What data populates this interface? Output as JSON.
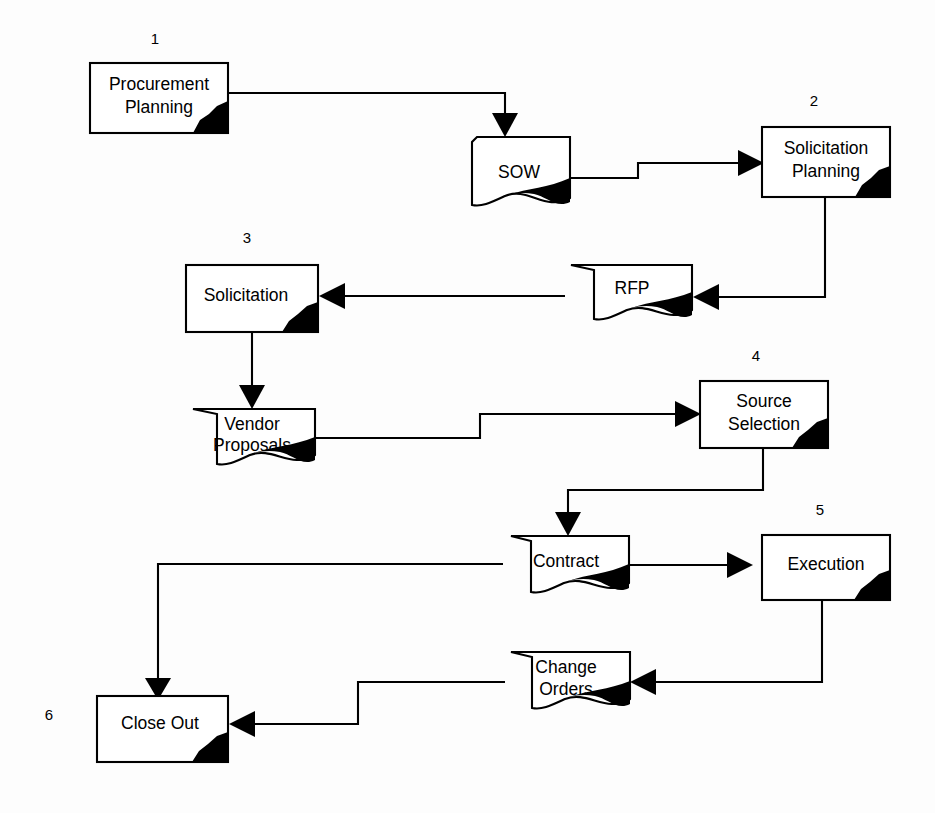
{
  "diagram": {
    "background_color": "#fdfdfd",
    "line_color": "#000000",
    "shape_fill": "#ffffff",
    "shadow_color": "#000000",
    "nodes": [
      {
        "id": "procurement-planning",
        "shape": "process-box",
        "line1": "Procurement",
        "line2": "Planning",
        "step_number": "1"
      },
      {
        "id": "sow",
        "shape": "document",
        "line1": "SOW",
        "line2": "",
        "step_number": ""
      },
      {
        "id": "solicitation-planning",
        "shape": "process-box",
        "line1": "Solicitation",
        "line2": "Planning",
        "step_number": "2"
      },
      {
        "id": "solicitation",
        "shape": "process-box",
        "line1": "Solicitation",
        "line2": "",
        "step_number": "3"
      },
      {
        "id": "rfp",
        "shape": "document",
        "line1": "RFP",
        "line2": "",
        "step_number": ""
      },
      {
        "id": "vendor-proposals",
        "shape": "document",
        "line1": "Vendor",
        "line2": "Proposals",
        "step_number": ""
      },
      {
        "id": "source-selection",
        "shape": "process-box",
        "line1": "Source",
        "line2": "Selection",
        "step_number": "4"
      },
      {
        "id": "contract",
        "shape": "document",
        "line1": "Contract",
        "line2": "",
        "step_number": ""
      },
      {
        "id": "execution",
        "shape": "process-box",
        "line1": "Execution",
        "line2": "",
        "step_number": "5"
      },
      {
        "id": "change-orders",
        "shape": "document",
        "line1": "Change",
        "line2": "Orders",
        "step_number": ""
      },
      {
        "id": "close-out",
        "shape": "process-box",
        "line1": "Close Out",
        "line2": "",
        "step_number": "6"
      }
    ],
    "edges": [
      {
        "id": "edge-planning-to-sow",
        "from": "procurement-planning",
        "to": "sow"
      },
      {
        "id": "edge-sow-to-solicitation-planning",
        "from": "sow",
        "to": "solicitation-planning"
      },
      {
        "id": "edge-solicitation-planning-to-rfp",
        "from": "solicitation-planning",
        "to": "rfp"
      },
      {
        "id": "edge-rfp-to-solicitation",
        "from": "rfp",
        "to": "solicitation"
      },
      {
        "id": "edge-solicitation-to-vendor-proposals",
        "from": "solicitation",
        "to": "vendor-proposals"
      },
      {
        "id": "edge-vendor-proposals-to-source-selection",
        "from": "vendor-proposals",
        "to": "source-selection"
      },
      {
        "id": "edge-source-selection-to-contract",
        "from": "source-selection",
        "to": "contract"
      },
      {
        "id": "edge-contract-to-execution",
        "from": "contract",
        "to": "execution"
      },
      {
        "id": "edge-execution-to-change-orders",
        "from": "execution",
        "to": "change-orders"
      },
      {
        "id": "edge-change-orders-to-close-out",
        "from": "change-orders",
        "to": "close-out"
      },
      {
        "id": "edge-contract-to-close-out",
        "from": "contract",
        "to": "close-out"
      }
    ]
  }
}
